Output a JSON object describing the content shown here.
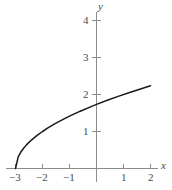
{
  "chart_data": {
    "type": "line",
    "title": "",
    "xlabel": "x",
    "ylabel": "y",
    "function": "y = sqrt(x + 3)",
    "xlim": [
      -3.3,
      2.4
    ],
    "ylim": [
      -0.25,
      4.5
    ],
    "grid": false,
    "legend": false,
    "xticks": [
      -3,
      -2,
      -1,
      1,
      2
    ],
    "xtick_labels": [
      "−3",
      "−2",
      "−1",
      "1",
      "2"
    ],
    "yticks": [
      1,
      2,
      3,
      4
    ],
    "ytick_labels": [
      "1",
      "2",
      "3",
      "4"
    ],
    "series": [
      {
        "name": "y = sqrt(x + 3)",
        "x": [
          -3,
          -2.9,
          -2.8,
          -2.7,
          -2.6,
          -2.5,
          -2.4,
          -2.2,
          -2.0,
          -1.8,
          -1.5,
          -1.2,
          -1.0,
          -0.6,
          -0.2,
          0,
          0.4,
          0.8,
          1.2,
          1.6,
          2.0
        ],
        "y": [
          0,
          0.316,
          0.447,
          0.548,
          0.632,
          0.707,
          0.775,
          0.894,
          1.0,
          1.095,
          1.225,
          1.342,
          1.414,
          1.549,
          1.673,
          1.732,
          1.844,
          1.949,
          2.049,
          2.144,
          2.236
        ]
      }
    ],
    "colors": {
      "curve": "#1a1a1a",
      "axis": "#8c8c8c",
      "tick_text": "#4a4a4a",
      "background": "#ffffff"
    }
  },
  "axes": {
    "x_label": "x",
    "y_label": "y"
  },
  "xtick_labels": {
    "t0": "−3",
    "t1": "−2",
    "t2": "−1",
    "t3": "1",
    "t4": "2"
  },
  "ytick_labels": {
    "t0": "1",
    "t1": "2",
    "t2": "3",
    "t3": "4"
  }
}
